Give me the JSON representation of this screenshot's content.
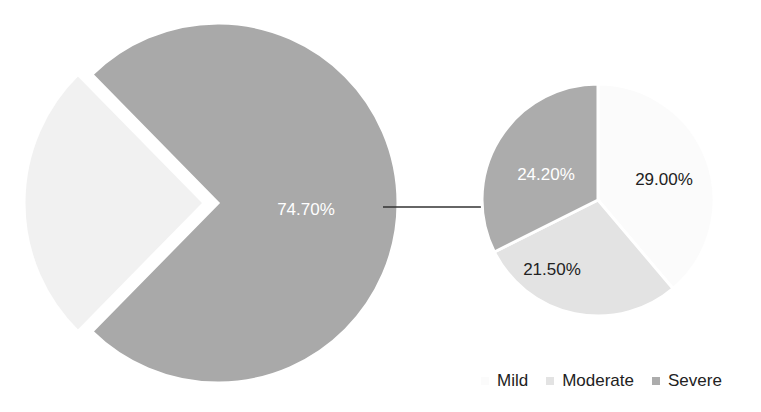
{
  "chart_data": {
    "type": "pie",
    "subtype": "pie-of-pie",
    "title": "",
    "main_pie": {
      "slices": [
        {
          "name": "Other",
          "value": 25.3,
          "label": "",
          "color": "#f1f1f1",
          "exploded": true
        },
        {
          "name": "Group",
          "value": 74.7,
          "label": "74.70%",
          "color": "#a9a9a9",
          "exploded": false
        }
      ]
    },
    "secondary_pie": {
      "slices": [
        {
          "name": "Mild",
          "value": 29.0,
          "label": "29.00%",
          "color": "#fbfbfb"
        },
        {
          "name": "Moderate",
          "value": 21.5,
          "label": "21.50%",
          "color": "#e3e3e3"
        },
        {
          "name": "Severe",
          "value": 24.2,
          "label": "24.20%",
          "color": "#acacac"
        }
      ]
    },
    "legend": {
      "position": "bottom-right",
      "entries": [
        "Mild",
        "Moderate",
        "Severe"
      ]
    },
    "connector": "arrow from main slice 74.70% to secondary pie"
  },
  "legend": {
    "items": [
      {
        "label": "Mild",
        "color": "#fbfbfb"
      },
      {
        "label": "Moderate",
        "color": "#e3e3e3"
      },
      {
        "label": "Severe",
        "color": "#acacac"
      }
    ]
  }
}
